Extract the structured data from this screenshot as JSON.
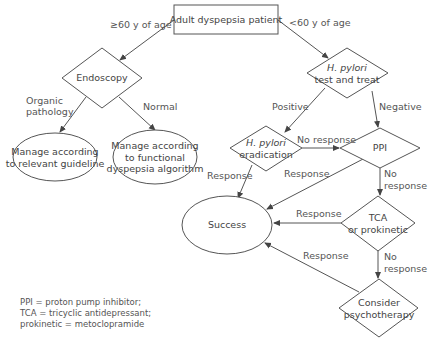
{
  "diagram": {
    "type": "flowchart",
    "nodes": {
      "start": {
        "label": "Adult dyspepsia patient",
        "shape": "rectangle"
      },
      "endoscopy": {
        "label": "Endoscopy",
        "shape": "diamond"
      },
      "hpylori_test": {
        "label_italic": "H. pylori",
        "label": "test and treat",
        "shape": "diamond"
      },
      "relevant_guideline": {
        "line1": "Manage according",
        "line2": "to relevant guideline",
        "shape": "ellipse"
      },
      "functional_algorithm": {
        "line1": "Manage according",
        "line2": "to functional",
        "line3": "dyspepsia algorithm",
        "shape": "ellipse"
      },
      "eradication": {
        "label_italic": "H. pylori",
        "label": "eradication",
        "shape": "diamond"
      },
      "ppi": {
        "label": "PPI",
        "shape": "diamond"
      },
      "success": {
        "label": "Success",
        "shape": "ellipse"
      },
      "tca": {
        "line1": "TCA",
        "line2": "or prokinetic",
        "shape": "diamond"
      },
      "psychotherapy": {
        "line1": "Consider",
        "line2": "psychotherapy",
        "shape": "diamond"
      }
    },
    "edges": {
      "age_over_60": "≥60 y of age",
      "age_under_60": "<60 y of age",
      "organic_line1": "Organic",
      "organic_line2": "pathology",
      "normal": "Normal",
      "positive": "Positive",
      "negative": "Negative",
      "erad_no_response": "No response",
      "erad_response": "Response",
      "ppi_response": "Response",
      "ppi_no_response_1": "No",
      "ppi_no_response_2": "response",
      "tca_response": "Response",
      "tca_no_response_1": "No",
      "tca_no_response_2": "response",
      "psych_response": "Response"
    }
  },
  "legend": {
    "line1": "PPI = proton pump inhibitor;",
    "line2": "TCA = tricyclic antidepressant;",
    "line3": "prokinetic = metoclopramide"
  },
  "colors": {
    "stroke": "#555555",
    "text": "#444444",
    "background": "#ffffff"
  }
}
